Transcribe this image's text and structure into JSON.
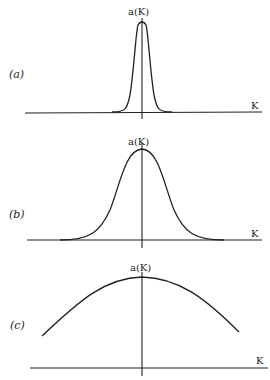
{
  "figure": {
    "panels": [
      {
        "id": "a",
        "label": "(a)",
        "function_label": "a(K)",
        "axis_label": "K",
        "shape": "narrow peak"
      },
      {
        "id": "b",
        "label": "(b)",
        "function_label": "a(K)",
        "axis_label": "K",
        "shape": "medium-width peak"
      },
      {
        "id": "c",
        "label": "(c)",
        "function_label": "a(K)",
        "axis_label": "K",
        "shape": "broad peak"
      }
    ],
    "colors": {
      "line": "#222222",
      "background": "#ffffff"
    }
  }
}
